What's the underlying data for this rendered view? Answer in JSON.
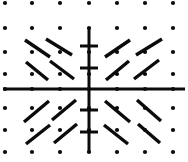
{
  "figure": {
    "width": 188,
    "height": 162,
    "background_color": "#ffffff",
    "ink_color": "#0b0b0b"
  },
  "chart_data": {
    "type": "scatter",
    "subtitle": "Direction field with short line segments in four quadrants",
    "xlabel": "",
    "ylabel": "",
    "grid": true,
    "grid_style": "dotted-paper",
    "legend": false,
    "legend_position": "none",
    "axes": {
      "origin_px": [
        89,
        89
      ],
      "horizontal_axis": {
        "visible": true,
        "y_px": 89,
        "x_start_px": 3,
        "x_end_px": 185,
        "stroke_width": 3,
        "ticks": []
      },
      "vertical_axis": {
        "visible": true,
        "x_px": 89,
        "y_start_px": 28,
        "y_end_px": 153,
        "stroke_width": 3,
        "ticks_px": [
          46,
          68,
          110,
          132
        ],
        "tick_half_length_px": 9,
        "tick_stroke_width": 3
      }
    },
    "dot_grid": {
      "dot_radius_px": 2.1,
      "x_positions_px": [
        5,
        32,
        60,
        89,
        117,
        145,
        173
      ],
      "y_positions_px": [
        3,
        28,
        52,
        74,
        89,
        108,
        130,
        152
      ]
    },
    "segments": [
      {
        "quadrant": "upper-left",
        "slope_sign": "negative",
        "x1": 25,
        "y1": 40,
        "x2": 50,
        "y2": 57
      },
      {
        "quadrant": "upper-left",
        "slope_sign": "negative",
        "x1": 46,
        "y1": 39,
        "x2": 72,
        "y2": 55
      },
      {
        "quadrant": "upper-left",
        "slope_sign": "negative",
        "x1": 26,
        "y1": 62,
        "x2": 48,
        "y2": 80
      },
      {
        "quadrant": "upper-left",
        "slope_sign": "negative",
        "x1": 50,
        "y1": 61,
        "x2": 74,
        "y2": 79
      },
      {
        "quadrant": "upper-right",
        "slope_sign": "positive",
        "x1": 105,
        "y1": 57,
        "x2": 130,
        "y2": 40
      },
      {
        "quadrant": "upper-right",
        "slope_sign": "positive",
        "x1": 136,
        "y1": 55,
        "x2": 162,
        "y2": 39
      },
      {
        "quadrant": "upper-right",
        "slope_sign": "positive",
        "x1": 106,
        "y1": 80,
        "x2": 129,
        "y2": 61
      },
      {
        "quadrant": "upper-right",
        "slope_sign": "positive",
        "x1": 134,
        "y1": 79,
        "x2": 159,
        "y2": 60
      },
      {
        "quadrant": "lower-left",
        "slope_sign": "positive",
        "x1": 24,
        "y1": 122,
        "x2": 49,
        "y2": 101
      },
      {
        "quadrant": "lower-left",
        "slope_sign": "positive",
        "x1": 52,
        "y1": 120,
        "x2": 76,
        "y2": 100
      },
      {
        "quadrant": "lower-left",
        "slope_sign": "positive",
        "x1": 26,
        "y1": 144,
        "x2": 50,
        "y2": 125
      },
      {
        "quadrant": "lower-left",
        "slope_sign": "positive",
        "x1": 54,
        "y1": 143,
        "x2": 77,
        "y2": 124
      },
      {
        "quadrant": "lower-right",
        "slope_sign": "negative",
        "x1": 105,
        "y1": 101,
        "x2": 130,
        "y2": 122
      },
      {
        "quadrant": "lower-right",
        "slope_sign": "negative",
        "x1": 137,
        "y1": 100,
        "x2": 161,
        "y2": 121
      },
      {
        "quadrant": "lower-right",
        "slope_sign": "negative",
        "x1": 104,
        "y1": 125,
        "x2": 128,
        "y2": 144
      },
      {
        "quadrant": "lower-right",
        "slope_sign": "negative",
        "x1": 138,
        "y1": 124,
        "x2": 160,
        "y2": 143
      }
    ],
    "segment_stroke_width": 3.4,
    "symmetry": "segments mirror across both axes; slopes negative in quadrant II and IV, positive in quadrant I and III"
  }
}
